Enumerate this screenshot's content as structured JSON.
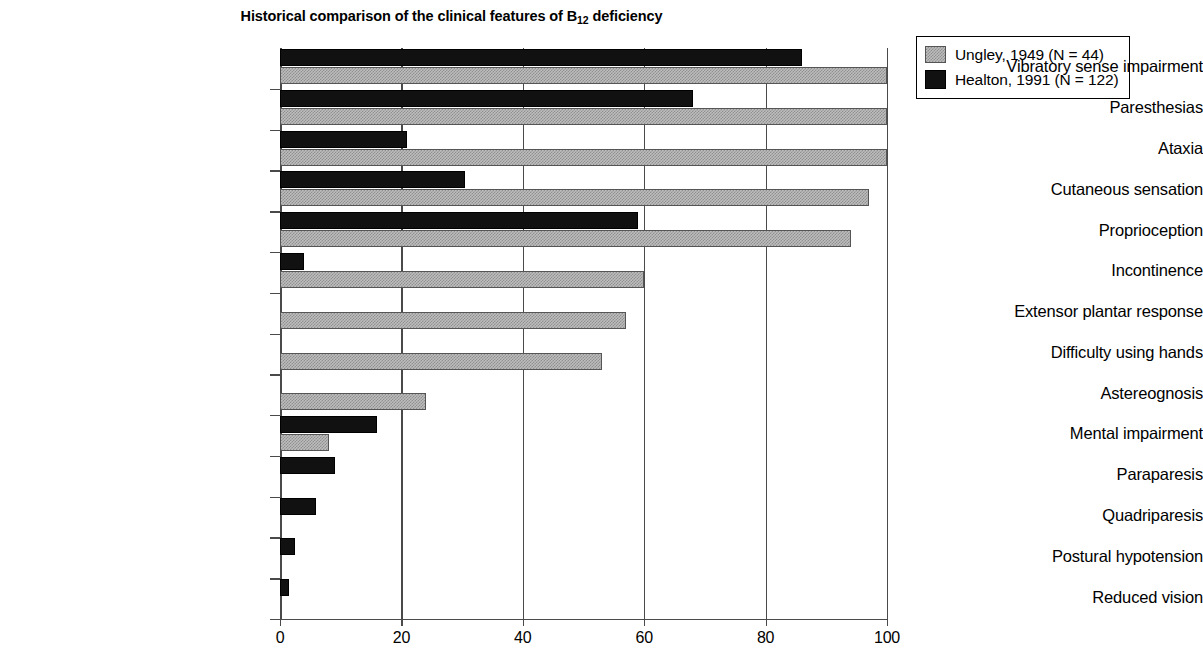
{
  "chart_data": {
    "type": "bar",
    "orientation": "horizontal",
    "title": "Historical comparison of the clinical features of B12 deficiency",
    "title_parts": {
      "before_sub": "Historical comparison of the clinical features of B",
      "sub": "12",
      "after_sub": " deficiency"
    },
    "xlabel": "",
    "ylabel": "",
    "xlim": [
      0,
      100
    ],
    "ylim": [
      0,
      14
    ],
    "xticks": [
      0,
      20,
      40,
      60,
      80,
      100
    ],
    "xticklabels": [
      "0",
      "20",
      "40",
      "60",
      "80",
      "100"
    ],
    "grid": "vertical",
    "legend_position": "upper-right-outside",
    "categories": [
      "Vibratory sense impairment",
      "Paresthesias",
      "Ataxia",
      "Cutaneous sensation",
      "Proprioception",
      "Incontinence",
      "Extensor plantar response",
      "Difficulty using hands",
      "Astereognosis",
      "Mental impairment",
      "Paraparesis",
      "Quadriparesis",
      "Postural hypotension",
      "Reduced vision"
    ],
    "series": [
      {
        "name": "Ungley, 1949 (N = 44)",
        "color": "#bdbdbd",
        "pattern": "checker-dither",
        "values": [
          100,
          100,
          100,
          97,
          94,
          60,
          57,
          53,
          24,
          8,
          0,
          0,
          0,
          0
        ]
      },
      {
        "name": "Healton, 1991 (N = 122)",
        "color": "#111111",
        "pattern": "solid",
        "values": [
          86,
          68,
          21,
          30.5,
          59,
          4,
          0,
          0,
          0,
          16,
          9,
          6,
          2.5,
          1.5
        ]
      }
    ]
  },
  "legend": {
    "items": [
      {
        "label": "Ungley, 1949 (N = 44)",
        "swatch": "gray-checker"
      },
      {
        "label": "Healton, 1991 (N = 122)",
        "swatch": "black-solid"
      }
    ]
  }
}
